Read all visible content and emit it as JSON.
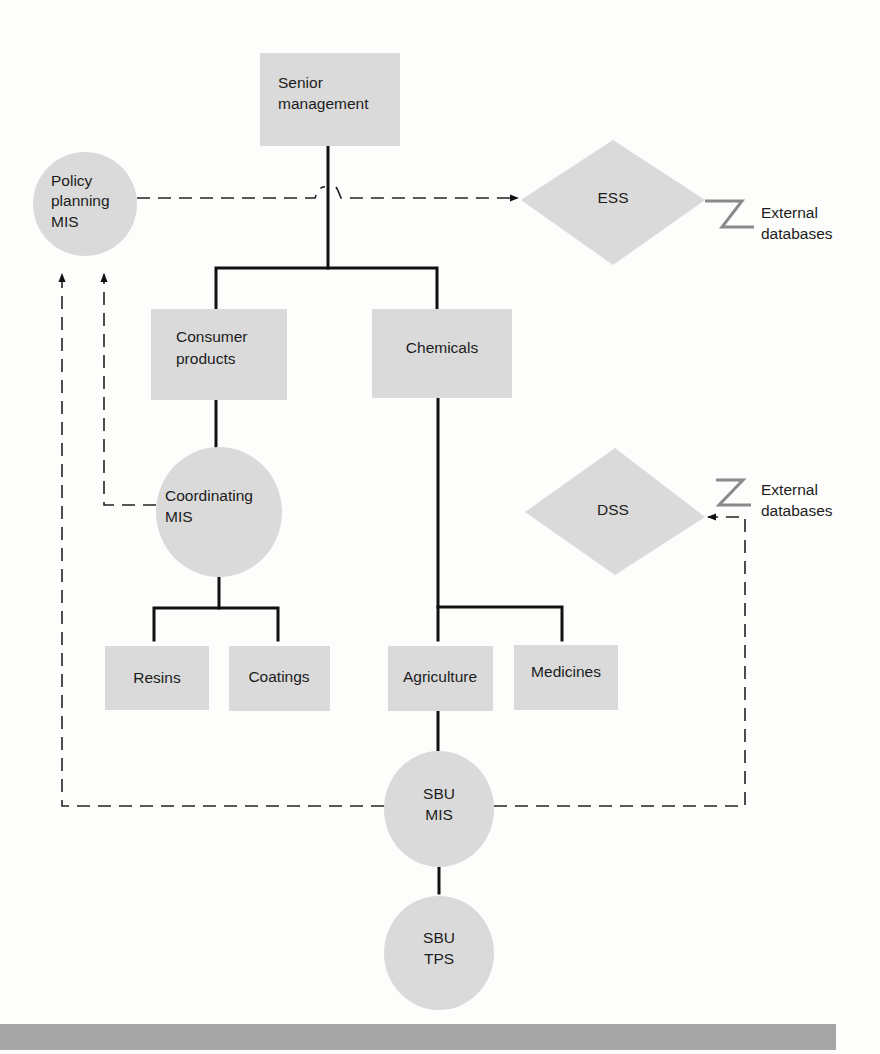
{
  "diagram": {
    "nodes": {
      "senior_management": {
        "line1": "Senior",
        "line2": "management",
        "shape": "rectangle"
      },
      "policy_planning_mis": {
        "line1": "Policy",
        "line2": "planning",
        "line3": "MIS",
        "shape": "circle"
      },
      "ess": {
        "label": "ESS",
        "shape": "diamond"
      },
      "consumer_products": {
        "line1": "Consumer",
        "line2": "products",
        "shape": "rectangle"
      },
      "chemicals": {
        "label": "Chemicals",
        "shape": "rectangle"
      },
      "coordinating_mis": {
        "line1": "Coordinating",
        "line2": "MIS",
        "shape": "circle"
      },
      "dss": {
        "label": "DSS",
        "shape": "diamond"
      },
      "resins": {
        "label": "Resins",
        "shape": "rectangle"
      },
      "coatings": {
        "label": "Coatings",
        "shape": "rectangle"
      },
      "agriculture": {
        "label": "Agriculture",
        "shape": "rectangle"
      },
      "medicines": {
        "label": "Medicines",
        "shape": "rectangle"
      },
      "sbu_mis": {
        "line1": "SBU",
        "line2": "MIS",
        "shape": "circle"
      },
      "sbu_tps": {
        "line1": "SBU",
        "line2": "TPS",
        "shape": "circle"
      }
    },
    "external": {
      "ess_ext": {
        "line1": "External",
        "line2": "databases"
      },
      "dss_ext": {
        "line1": "External",
        "line2": "databases"
      }
    },
    "edges": [
      {
        "from": "Senior management",
        "to": "Consumer products",
        "style": "solid"
      },
      {
        "from": "Senior management",
        "to": "Chemicals",
        "style": "solid"
      },
      {
        "from": "Consumer products",
        "to": "Coordinating MIS",
        "style": "solid"
      },
      {
        "from": "Coordinating MIS",
        "to": "Resins",
        "style": "solid"
      },
      {
        "from": "Coordinating MIS",
        "to": "Coatings",
        "style": "solid"
      },
      {
        "from": "Chemicals",
        "to": "Agriculture",
        "style": "solid"
      },
      {
        "from": "Chemicals",
        "to": "Medicines",
        "style": "solid"
      },
      {
        "from": "Agriculture",
        "to": "SBU MIS",
        "style": "solid"
      },
      {
        "from": "SBU MIS",
        "to": "SBU TPS",
        "style": "solid"
      },
      {
        "from": "Policy planning MIS",
        "to": "ESS",
        "style": "dashed-arrow"
      },
      {
        "from": "Coordinating MIS",
        "to": "Policy planning MIS",
        "style": "dashed-arrow"
      },
      {
        "from": "SBU MIS",
        "to": "Policy planning MIS",
        "style": "dashed-arrow"
      },
      {
        "from": "SBU MIS",
        "to": "DSS",
        "style": "dashed-arrow"
      },
      {
        "from": "External databases",
        "to": "ESS",
        "style": "z-link"
      },
      {
        "from": "External databases",
        "to": "DSS",
        "style": "z-link"
      }
    ],
    "colors": {
      "node_fill": "#dadada",
      "line": "#111111",
      "z_link": "#8a8a8a",
      "band": "#a6a6a6",
      "background": "#fdfdfb"
    }
  }
}
